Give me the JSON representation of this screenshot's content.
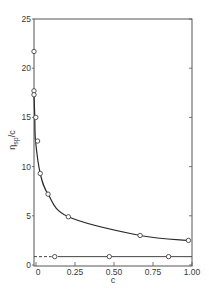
{
  "chart_data": {
    "type": "line",
    "title": "",
    "xlabel": "c",
    "ylabel": "η_sp/c",
    "ylabel_main": "η",
    "ylabel_sub": "sp",
    "ylabel_tail": "/c",
    "xlim": [
      0,
      1.0
    ],
    "ylim": [
      0,
      25
    ],
    "grid": false,
    "legend": null,
    "x_ticks": [
      0,
      0.25,
      0.5,
      0.75,
      1.0
    ],
    "x_tick_labels": [
      "0",
      "0.25",
      "0.50",
      "0.75",
      "1.00"
    ],
    "y_ticks": [
      0,
      5,
      10,
      15,
      20,
      25
    ],
    "y_tick_labels": [
      "0",
      "5",
      "10",
      "15",
      "20",
      "25"
    ],
    "series": [
      {
        "name": "upper curve",
        "marker": "open-circle",
        "line": "solid smooth",
        "x": [
          0.0,
          0.0,
          0.0,
          0.005,
          0.01,
          0.04,
          0.09,
          0.22,
          0.68,
          0.99
        ],
        "y": [
          21.7,
          17.7,
          17.3,
          15.0,
          12.6,
          9.3,
          7.2,
          4.9,
          3.0,
          2.5
        ]
      },
      {
        "name": "lower line",
        "marker": "open-circle",
        "line": "solid, dashed extrapolation to c=0",
        "x": [
          0.12,
          0.47,
          0.85
        ],
        "y": [
          0.85,
          0.85,
          0.85
        ],
        "extrapolated_intercept": 0.85
      }
    ]
  }
}
